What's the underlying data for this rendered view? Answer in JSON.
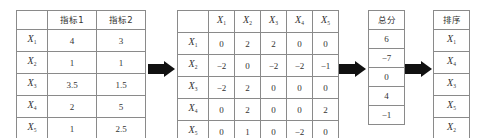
{
  "table1": {
    "headers": [
      "",
      "指标1",
      "指标2"
    ],
    "rows": [
      {
        "var": "X",
        "sub": "1",
        "v1": "4",
        "v2": "3"
      },
      {
        "var": "X",
        "sub": "2",
        "v1": "1",
        "v2": "1"
      },
      {
        "var": "X",
        "sub": "3",
        "v1": "3.5",
        "v2": "1.5"
      },
      {
        "var": "X",
        "sub": "4",
        "v1": "2",
        "v2": "5"
      },
      {
        "var": "X",
        "sub": "5",
        "v1": "1",
        "v2": "2.5"
      }
    ]
  },
  "table2": {
    "col_headers": [
      {
        "var": "X",
        "sub": "1"
      },
      {
        "var": "X",
        "sub": "2"
      },
      {
        "var": "X",
        "sub": "3"
      },
      {
        "var": "X",
        "sub": "4"
      },
      {
        "var": "X",
        "sub": "5"
      }
    ],
    "rows": [
      {
        "var": "X",
        "sub": "1",
        "values": [
          "0",
          "2",
          "2",
          "0",
          "0"
        ]
      },
      {
        "var": "X",
        "sub": "2",
        "values": [
          "−2",
          "0",
          "−2",
          "−2",
          "−1"
        ]
      },
      {
        "var": "X",
        "sub": "3",
        "values": [
          "−2",
          "2",
          "0",
          "0",
          "0"
        ]
      },
      {
        "var": "X",
        "sub": "4",
        "values": [
          "0",
          "2",
          "0",
          "0",
          "2"
        ]
      },
      {
        "var": "X",
        "sub": "5",
        "values": [
          "0",
          "1",
          "0",
          "−2",
          "0"
        ]
      }
    ]
  },
  "table3": {
    "header": "总分",
    "values": [
      "6",
      "−7",
      "0",
      "4",
      "−1"
    ]
  },
  "table4": {
    "header": "排序",
    "items": [
      {
        "var": "X",
        "sub": "1"
      },
      {
        "var": "X",
        "sub": "4"
      },
      {
        "var": "X",
        "sub": "3"
      },
      {
        "var": "X",
        "sub": "5"
      },
      {
        "var": "X",
        "sub": "2"
      }
    ]
  },
  "arrows": [
    "right-arrow",
    "right-arrow",
    "right-arrow"
  ]
}
